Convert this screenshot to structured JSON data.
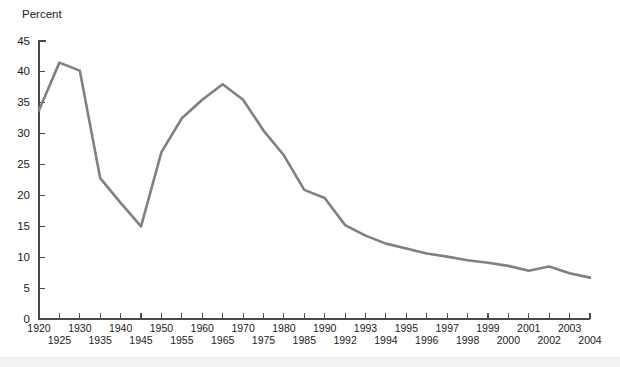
{
  "chart_data": {
    "type": "line",
    "title": "",
    "subtitle": "",
    "xlabel": "",
    "ylabel": "Percent",
    "ylim": [
      0,
      45
    ],
    "ytick_step": 5,
    "yticks": [
      0,
      5,
      10,
      15,
      20,
      25,
      30,
      35,
      40,
      45
    ],
    "ytick_labels": [
      "0",
      "5",
      "10",
      "15",
      "20",
      "25",
      "30",
      "35",
      "40",
      "45"
    ],
    "grid": false,
    "legend": "none",
    "legend_position": "none",
    "line_color": "#808080",
    "axis_color": "#4a4a4a",
    "text_color": "#1b1b1b",
    "background_color": "#ffffff",
    "xtick_labels": [
      "1920",
      "1925",
      "1930",
      "1935",
      "1940",
      "1945",
      "1950",
      "1955",
      "1960",
      "1965",
      "1970",
      "1975",
      "1980",
      "1985",
      "1990",
      "1992",
      "1993",
      "1994",
      "1995",
      "1996",
      "1997",
      "1998",
      "1999",
      "2000",
      "2001",
      "2002",
      "2003",
      "2004"
    ],
    "xtick_row": [
      "top",
      "bottom",
      "top",
      "bottom",
      "top",
      "bottom",
      "top",
      "bottom",
      "top",
      "bottom",
      "top",
      "bottom",
      "top",
      "bottom",
      "top",
      "bottom",
      "top",
      "bottom",
      "top",
      "bottom",
      "top",
      "bottom",
      "top",
      "bottom",
      "top",
      "bottom",
      "top",
      "bottom"
    ],
    "categories": [
      "1920",
      "1925",
      "1930",
      "1935",
      "1940",
      "1945",
      "1950",
      "1955",
      "1960",
      "1965",
      "1970",
      "1975",
      "1980",
      "1985",
      "1990",
      "1992",
      "1993",
      "1994",
      "1995",
      "1996",
      "1997",
      "1998",
      "1999",
      "2000",
      "2001",
      "2002",
      "2003",
      "2004"
    ],
    "values": [
      33.8,
      41.5,
      40.2,
      22.8,
      18.8,
      15.0,
      27.0,
      32.5,
      35.5,
      38.0,
      35.5,
      30.5,
      26.5,
      20.9,
      19.6,
      15.2,
      13.5,
      12.2,
      11.4,
      10.6,
      10.1,
      9.5,
      9.1,
      8.6,
      7.8,
      8.5,
      7.4,
      6.7
    ]
  },
  "layout": {
    "plot_left": 39,
    "plot_right": 590,
    "plot_top": 41,
    "plot_bottom": 319
  }
}
